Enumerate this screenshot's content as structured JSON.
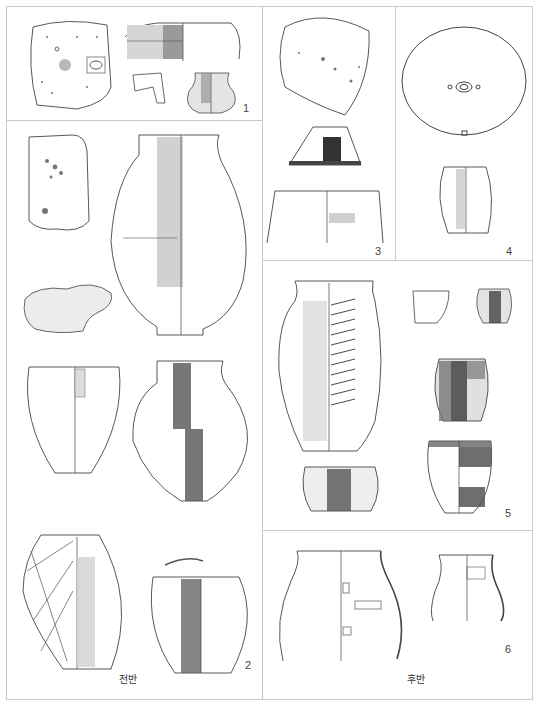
{
  "plate": {
    "type": "archaeological pottery and artifact line-drawing plate",
    "panels": [
      {
        "id": "panel-1",
        "number": "1",
        "contents": [
          "stone slab with pitted surface",
          "bowl rim section",
          "rim fragment",
          "small globular jar"
        ]
      },
      {
        "id": "panel-2",
        "number": "2",
        "contents": [
          "stone slab",
          "grinding stone",
          "large ovoid jar",
          "deep bowl",
          "globular jar",
          "lattice-incised jar",
          "deep jar with lid fragment"
        ]
      },
      {
        "id": "panel-3",
        "number": "3",
        "contents": [
          "stone slab",
          "conical lid / stand",
          "wide-mouthed bowl"
        ]
      },
      {
        "id": "panel-4",
        "number": "4",
        "contents": [
          "round plate with central perforation",
          "small ovoid jar"
        ]
      },
      {
        "id": "panel-5",
        "number": "5",
        "contents": [
          "tall jar with herringbone band",
          "small cup",
          "small jar",
          "medium jar",
          "round-bottomed bowl",
          "deep bowl"
        ]
      },
      {
        "id": "panel-6",
        "number": "6",
        "contents": [
          "wide jar with finger impressions",
          "jar with finger impressions"
        ]
      }
    ],
    "period_labels": {
      "early": "전반",
      "late": "후반"
    },
    "colors": {
      "line": "#333333",
      "frame": "#c9c9c9",
      "shade_dark": "#555555",
      "shade_mid": "#9a9a9a",
      "shade_light": "#d6d6d6"
    }
  }
}
